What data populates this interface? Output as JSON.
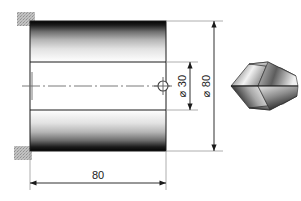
{
  "drawing": {
    "title": "Cylindrical bore technical drawing",
    "units": "mm",
    "dimensions": {
      "length_label": "80",
      "outer_diameter_label": "⌀ 80",
      "inner_diameter_label": "⌀ 30",
      "outer_diameter_symbol": "⌀",
      "outer_diameter_value": "80",
      "inner_diameter_symbol": "⌀",
      "inner_diameter_value": "30"
    },
    "parts": {
      "cylinder_name": "cylinder-body",
      "bore_name": "inner-bore",
      "centerline_name": "center-axis",
      "center_marker_name": "center-point-marker",
      "drill_name": "drill-bit-tip"
    },
    "colors": {
      "line": "#1a1a1a",
      "thin_line": "#7a7a7a",
      "shade_dark": "#050505",
      "shade_light": "#ffffff",
      "corner_mark": "#b8b8b8",
      "background": "#ffffff"
    }
  }
}
